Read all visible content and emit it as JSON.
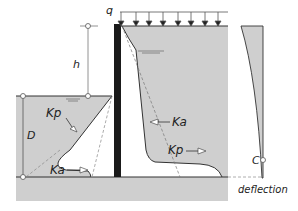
{
  "diagram": {
    "labels": {
      "surcharge": "q",
      "retained_height": "h",
      "embedment_depth": "D",
      "passive_left": "Kp",
      "active_left": "Ka",
      "active_right": "Ka",
      "passive_right": "Kp",
      "rotation_point": "C",
      "deflection": "deflection"
    },
    "colors": {
      "soil": "#cfcfcf",
      "wall": "#1a1a1a",
      "line": "#333333",
      "dashed": "#888888"
    }
  }
}
